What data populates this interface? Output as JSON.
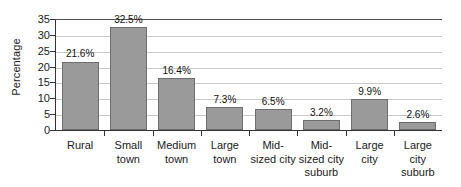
{
  "chart_data": {
    "type": "bar",
    "title": "",
    "xlabel": "",
    "ylabel": "Percentage",
    "ylim": [
      0,
      35
    ],
    "ytick_step": 5,
    "yticks": [
      "35",
      "30",
      "25",
      "20",
      "15",
      "10",
      "5",
      "0"
    ],
    "grid": true,
    "legend": false,
    "categories": [
      "Rural",
      "Small town",
      "Medium town",
      "Large town",
      "Mid-sized city",
      "Mid-sized city suburb",
      "Large city",
      "Large city suburb"
    ],
    "category_lines": [
      [
        "Rural"
      ],
      [
        "Small",
        "town"
      ],
      [
        "Medium",
        "town"
      ],
      [
        "Large",
        "town"
      ],
      [
        "Mid-",
        "sized city"
      ],
      [
        "Mid-",
        "sized city",
        "suburb"
      ],
      [
        "Large",
        "city"
      ],
      [
        "Large",
        "city",
        "suburb"
      ]
    ],
    "values": [
      21.6,
      32.5,
      16.4,
      7.3,
      6.5,
      3.2,
      9.9,
      2.6
    ],
    "data_labels": [
      "21.6%",
      "32.5%",
      "16.4%",
      "7.3%",
      "6.5%",
      "3.2%",
      "9.9%",
      "2.6%"
    ],
    "bar_color": "#9a9a9a",
    "bar_border_color": "#6e6e6e",
    "gridline_color": "#c8c8c8",
    "axis_color": "#333333",
    "text_color": "#1a1a1a"
  }
}
